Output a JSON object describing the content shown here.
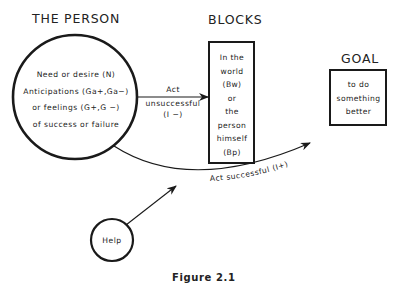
{
  "diagram": {
    "person": {
      "title": "THE PERSON",
      "lines": [
        "Need or desire (N)",
        "Anticipations (Ga+,Ga−)",
        "or feelings (G+,G −)",
        "of success or failure"
      ]
    },
    "blocks": {
      "title": "BLOCKS",
      "lines": [
        "In the",
        "world",
        "(Bw)",
        "or",
        "the",
        "person",
        "himself",
        "(Bp)"
      ]
    },
    "goal": {
      "title": "GOAL",
      "lines": [
        "to do",
        "something",
        "better"
      ]
    },
    "help": {
      "label": "Help"
    },
    "arrows": {
      "unsuccessful": {
        "line1": "Act",
        "line2": "unsuccessful",
        "line3": "(I −)"
      },
      "successful": {
        "label": "Act  successful (I+)"
      }
    },
    "caption": "Figure 2.1",
    "colors": {
      "stroke": "#1a1a1a",
      "background": "#ffffff"
    }
  }
}
